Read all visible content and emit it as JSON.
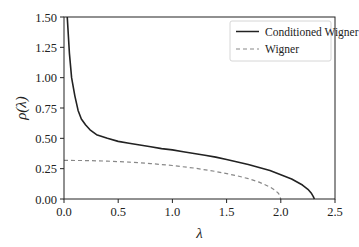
{
  "chart_data": {
    "type": "line",
    "title": "",
    "xlabel": "λ",
    "ylabel": "ρ(λ)",
    "xlim": [
      0.0,
      2.5
    ],
    "ylim": [
      0.0,
      1.5
    ],
    "xticks": [
      0.0,
      0.5,
      1.0,
      1.5,
      2.0,
      2.5
    ],
    "xtick_labels": [
      "0.0",
      "0.5",
      "1.0",
      "1.5",
      "2.0",
      "2.5"
    ],
    "yticks": [
      0.0,
      0.25,
      0.5,
      0.75,
      1.0,
      1.25,
      1.5
    ],
    "ytick_labels": [
      "0.00",
      "0.25",
      "0.50",
      "0.75",
      "1.00",
      "1.25",
      "1.50"
    ],
    "grid": false,
    "legend_position": "upper right",
    "series": [
      {
        "name": "Conditioned Wigner",
        "style": "solid",
        "color": "#222222",
        "x": [
          0.03,
          0.05,
          0.07,
          0.1,
          0.13,
          0.16,
          0.2,
          0.24,
          0.3,
          0.4,
          0.5,
          0.6,
          0.7,
          0.8,
          0.9,
          1.0,
          1.1,
          1.2,
          1.3,
          1.4,
          1.5,
          1.6,
          1.7,
          1.8,
          1.9,
          2.0,
          2.1,
          2.2,
          2.25,
          2.28,
          2.3,
          2.31
        ],
        "y": [
          1.5,
          1.2,
          1.0,
          0.85,
          0.73,
          0.66,
          0.61,
          0.57,
          0.53,
          0.5,
          0.475,
          0.46,
          0.445,
          0.43,
          0.415,
          0.405,
          0.39,
          0.375,
          0.36,
          0.345,
          0.325,
          0.305,
          0.285,
          0.26,
          0.235,
          0.2,
          0.165,
          0.115,
          0.08,
          0.05,
          0.02,
          0.0
        ]
      },
      {
        "name": "Wigner",
        "style": "dashed",
        "color": "#888888",
        "x": [
          0.0,
          0.2,
          0.4,
          0.6,
          0.8,
          1.0,
          1.2,
          1.4,
          1.6,
          1.7,
          1.8,
          1.9,
          1.95,
          1.98,
          2.0
        ],
        "y": [
          0.318,
          0.317,
          0.312,
          0.304,
          0.292,
          0.276,
          0.255,
          0.227,
          0.191,
          0.168,
          0.139,
          0.099,
          0.07,
          0.045,
          0.0
        ]
      }
    ]
  },
  "legend": {
    "items": [
      {
        "label": "Conditioned Wigner"
      },
      {
        "label": "Wigner"
      }
    ]
  }
}
